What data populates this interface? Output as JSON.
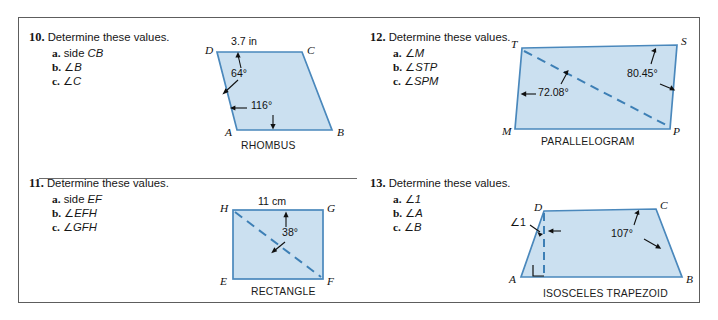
{
  "worksheet": {
    "problems": [
      {
        "number": "10.",
        "heading": "Determine these values.",
        "items": [
          {
            "label": "a.",
            "text": "side ",
            "italic": "CB"
          },
          {
            "label": "b.",
            "text": "∠",
            "italic": "B"
          },
          {
            "label": "c.",
            "text": "∠",
            "italic": "C"
          }
        ],
        "figure": {
          "caption": "RHOMBUS",
          "vertices": [
            "D",
            "C",
            "A",
            "B"
          ],
          "measures": [
            "3.7 in",
            "64°",
            "116°"
          ],
          "side_length": "3.7 in",
          "angle_top": "64°",
          "angle_bottom": "116°"
        }
      },
      {
        "number": "12.",
        "heading": "Determine these values.",
        "items": [
          {
            "label": "a.",
            "text": "∠",
            "italic": "M"
          },
          {
            "label": "b.",
            "text": "∠",
            "italic": "STP"
          },
          {
            "label": "c.",
            "text": "∠",
            "italic": "SPM"
          }
        ],
        "figure": {
          "caption": "PARALLELOGRAM",
          "vertices": [
            "T",
            "S",
            "M",
            "P"
          ],
          "measures": [
            "72.08°",
            "80.45°"
          ],
          "angle_left": "72.08°",
          "angle_right": "80.45°"
        }
      },
      {
        "number": "11.",
        "heading": "Determine these values.",
        "items": [
          {
            "label": "a.",
            "text": "side ",
            "italic": "EF"
          },
          {
            "label": "b.",
            "text": "∠",
            "italic": "EFH"
          },
          {
            "label": "c.",
            "text": "∠",
            "italic": "GFH"
          }
        ],
        "figure": {
          "caption": "RECTANGLE",
          "vertices": [
            "H",
            "G",
            "E",
            "F"
          ],
          "measures": [
            "11 cm",
            "38°"
          ],
          "side_length": "11 cm",
          "angle": "38°"
        }
      },
      {
        "number": "13.",
        "heading": "Determine these values.",
        "items": [
          {
            "label": "a.",
            "text": "∠",
            "italic": "1"
          },
          {
            "label": "b.",
            "text": "∠",
            "italic": "A"
          },
          {
            "label": "c.",
            "text": "∠",
            "italic": "B"
          }
        ],
        "figure": {
          "caption": "ISOSCELES TRAPEZOID",
          "vertices": [
            "D",
            "C",
            "A",
            "B"
          ],
          "measures": [
            "∠1",
            "107°"
          ],
          "angle_one": "∠1",
          "angle_right": "107°"
        }
      }
    ]
  },
  "style": {
    "shape_fill": "#cbe0f0",
    "shape_stroke": "#4a88bc",
    "dash_stroke": "#3d7fb5",
    "frame_stroke": "#5d5d5d",
    "text_color": "#161616"
  }
}
